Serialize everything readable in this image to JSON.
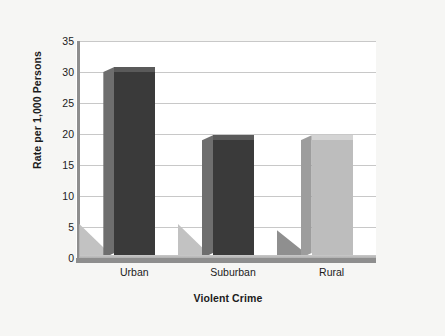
{
  "chart_data": {
    "type": "bar",
    "title": "",
    "subtitle": "",
    "xlabel": "Violent Crime",
    "ylabel": "Rate per 1,000 Persons",
    "categories": [
      "Urban",
      "Suburban",
      "Rural"
    ],
    "values": [
      30,
      19,
      19
    ],
    "series": [
      {
        "name": "Rate per 1,000 Persons",
        "values": [
          30,
          19,
          19
        ]
      }
    ],
    "ylim": [
      0,
      35
    ],
    "ytick_step": 5,
    "yticks": [
      0,
      5,
      10,
      15,
      20,
      25,
      30,
      35
    ],
    "ytick_labels": [
      "0",
      "5",
      "10",
      "15",
      "20",
      "25",
      "30",
      "35"
    ],
    "grid": true,
    "grid_axis": "y",
    "legend": false,
    "legend_position": "none",
    "style": "3d-column",
    "bar_colors": [
      "#3a3a3a",
      "#3a3a3a",
      "#bdbdbd"
    ],
    "bar_top_colors": [
      "#5a5a5a",
      "#5a5a5a",
      "#d4d4d4"
    ],
    "bar_side_colors": [
      "#6e6e6e",
      "#6e6e6e",
      "#9d9d9d"
    ],
    "wedge_colors": [
      "#c2c2c2",
      "#c2c2c2",
      "#8f8f8f"
    ],
    "wedge_tops": [
      5.5,
      5.5,
      4.5
    ],
    "annotations": []
  },
  "colors": {
    "page_background": "#f6f6f4",
    "plot_background": "#ffffff",
    "gridline": "#c8c8c8",
    "axis": "#8e8e8e",
    "text": "#1b1b1b"
  }
}
